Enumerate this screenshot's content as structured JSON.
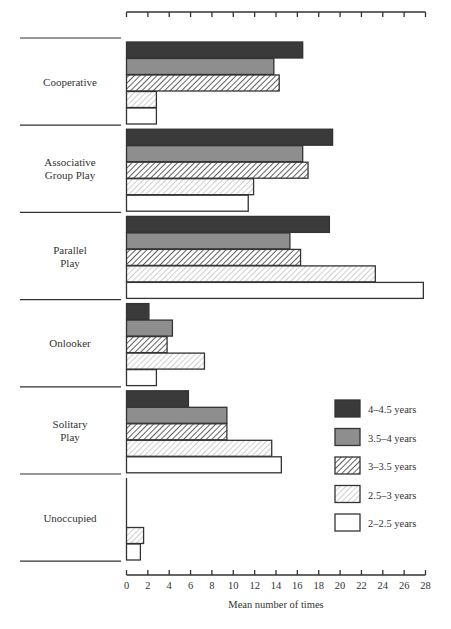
{
  "chart_data": {
    "type": "bar",
    "orientation": "horizontal",
    "title": "",
    "xlabel": "Mean number of times",
    "ylabel": "",
    "xlim": [
      0,
      28
    ],
    "xticks": [
      0,
      2,
      4,
      6,
      8,
      10,
      12,
      14,
      16,
      18,
      20,
      22,
      24,
      26,
      28
    ],
    "grid": false,
    "legend_position": "bottom-right",
    "categories": [
      {
        "label_lines": [
          "Cooperative"
        ]
      },
      {
        "label_lines": [
          "Associative",
          "Group Play"
        ]
      },
      {
        "label_lines": [
          "Parallel",
          "Play"
        ]
      },
      {
        "label_lines": [
          "Onlooker"
        ]
      },
      {
        "label_lines": [
          "Solitary",
          "Play"
        ]
      },
      {
        "label_lines": [
          "Unoccupied"
        ]
      }
    ],
    "series": [
      {
        "name": "4–4.5 years",
        "fill": "dark",
        "color": "#3a3a3a",
        "values": [
          16.5,
          19.3,
          19.0,
          2.1,
          5.8,
          0
        ]
      },
      {
        "name": "3.5–4 years",
        "fill": "gray",
        "color": "#8e8e8e",
        "values": [
          13.8,
          16.5,
          15.3,
          4.3,
          9.4,
          0
        ]
      },
      {
        "name": "3–3.5 years",
        "fill": "hatch-dense",
        "color": "#444444",
        "values": [
          14.3,
          17.0,
          16.3,
          3.8,
          9.4,
          0
        ]
      },
      {
        "name": "2.5–3 years",
        "fill": "hatch-light",
        "color": "#9a9a9a",
        "values": [
          2.8,
          11.9,
          23.3,
          7.3,
          13.6,
          1.6
        ]
      },
      {
        "name": "2–2.5 years",
        "fill": "white",
        "color": "#ffffff",
        "values": [
          2.8,
          11.4,
          27.8,
          2.8,
          14.5,
          1.3
        ]
      }
    ]
  }
}
